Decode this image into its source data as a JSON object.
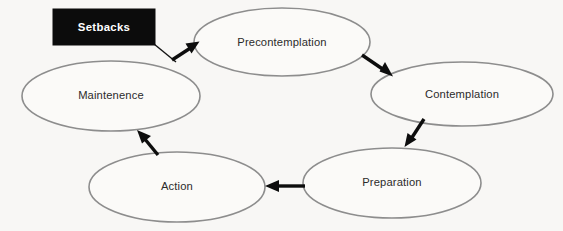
{
  "diagram": {
    "background_color": "#f8f7f5",
    "ellipse_stroke_color": "#8d8d8d",
    "ellipse_fill_color": "#fbfaf8",
    "label_text_color": "#2b2b2b",
    "arrow_color": "#0d0d0d",
    "nodes": [
      {
        "id": "precontemplation",
        "label": "Precontemplation",
        "cx": 282,
        "cy": 42,
        "rx": 88,
        "ry": 34
      },
      {
        "id": "contemplation",
        "label": "Contemplation",
        "cx": 462,
        "cy": 94,
        "rx": 91,
        "ry": 32
      },
      {
        "id": "preparation",
        "label": "Preparation",
        "cx": 392,
        "cy": 183,
        "rx": 89,
        "ry": 35
      },
      {
        "id": "action",
        "label": "Action",
        "cx": 177,
        "cy": 187,
        "rx": 88,
        "ry": 35
      },
      {
        "id": "maintenence",
        "label": "Maintenence",
        "cx": 111,
        "cy": 96,
        "rx": 89,
        "ry": 35
      }
    ],
    "callout": {
      "id": "setbacks",
      "label": "Setbacks",
      "x": 53,
      "y": 9,
      "width": 102,
      "height": 36,
      "fill_color": "#0c0c0c",
      "text_color": "#ffffff"
    },
    "arrows": [
      {
        "id": "setbacks-to-precontemplation",
        "from": "setbacks",
        "to": "precontemplation",
        "direction": "down-right"
      },
      {
        "id": "precontemplation-to-contemplation",
        "from": "precontemplation",
        "to": "contemplation",
        "direction": "down-right"
      },
      {
        "id": "contemplation-to-preparation",
        "from": "contemplation",
        "to": "preparation",
        "direction": "down-left"
      },
      {
        "id": "preparation-to-action",
        "from": "preparation",
        "to": "action",
        "direction": "left"
      },
      {
        "id": "action-to-maintenence",
        "from": "action",
        "to": "maintenence",
        "direction": "up-left"
      }
    ]
  }
}
